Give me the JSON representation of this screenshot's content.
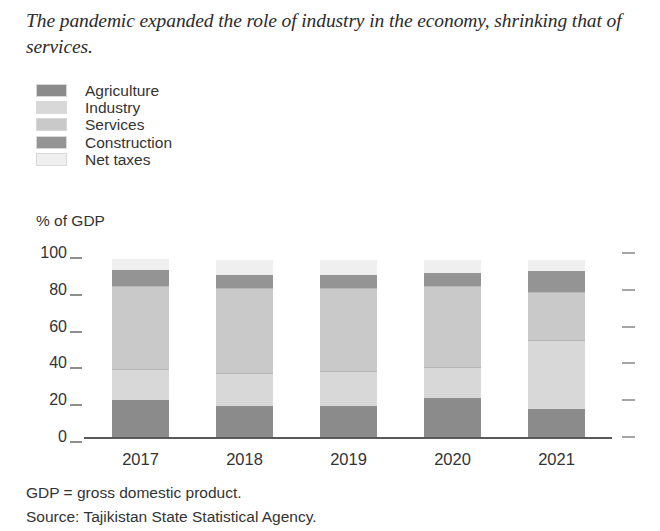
{
  "title": "The pandemic expanded the role of industry in the economy, shrinking that of services.",
  "y_unit_label": "% of GDP",
  "footnotes": [
    "GDP = gross domestic product.",
    "Source: Tajikistan State Statistical Agency."
  ],
  "colors": {
    "agriculture": "#8b8b8b",
    "industry": "#d8d8d8",
    "services": "#c9c9c9",
    "construction": "#949494",
    "net_taxes": "#efefef",
    "axis": "#5a5a5a",
    "tick": "#8e8e8e",
    "text": "#333333"
  },
  "chart_data": {
    "type": "bar",
    "stacked": true,
    "title": "The pandemic expanded the role of industry in the economy, shrinking that of services.",
    "xlabel": "",
    "ylabel": "% of GDP",
    "ylim": [
      0,
      100
    ],
    "yticks": [
      0,
      20,
      40,
      60,
      80,
      100
    ],
    "grid": false,
    "legend_position": "top-left",
    "categories": [
      "2017",
      "2018",
      "2019",
      "2020",
      "2021"
    ],
    "series": [
      {
        "name": "Agriculture",
        "color": "#8b8b8b",
        "values": [
          20,
          17,
          17,
          21,
          15
        ]
      },
      {
        "name": "Industry",
        "color": "#d8d8d8",
        "values": [
          17,
          18,
          19,
          17,
          38
        ]
      },
      {
        "name": "Services",
        "color": "#c9c9c9",
        "values": [
          45,
          46,
          45,
          44,
          26
        ]
      },
      {
        "name": "Construction",
        "color": "#949494",
        "values": [
          9,
          7,
          7,
          7,
          11
        ]
      },
      {
        "name": "Net taxes",
        "color": "#efefef",
        "values": [
          6,
          8,
          8,
          7,
          6
        ]
      }
    ]
  }
}
